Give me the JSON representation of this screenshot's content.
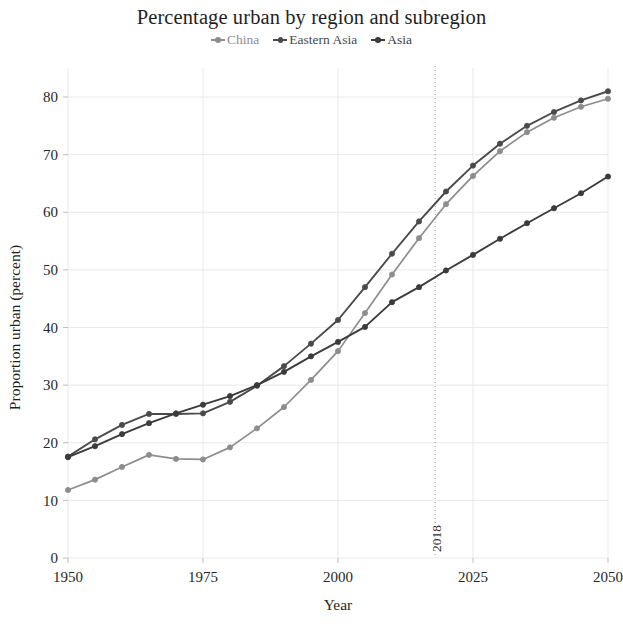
{
  "chart_data": {
    "type": "line",
    "title": "Percentage urban by region and subregion",
    "xlabel": "Year",
    "ylabel": "Proportion urban (percent)",
    "xlim": [
      1950,
      2050
    ],
    "ylim": [
      0,
      85
    ],
    "xticks": [
      1950,
      1975,
      2000,
      2025,
      2050
    ],
    "xticklabels": [
      "1950",
      "1975",
      "2000",
      "2025",
      "2050"
    ],
    "yticks": [
      0,
      10,
      20,
      30,
      40,
      50,
      60,
      70,
      80
    ],
    "yticklabels": [
      "0",
      "10",
      "20",
      "30",
      "40",
      "50",
      "60",
      "70",
      "80"
    ],
    "grid": true,
    "legend_position": "top-center",
    "markers": "circle",
    "x": [
      1950,
      1955,
      1960,
      1965,
      1970,
      1975,
      1980,
      1985,
      1990,
      1995,
      2000,
      2005,
      2010,
      2015,
      2020,
      2025,
      2030,
      2035,
      2040,
      2045,
      2050
    ],
    "series": [
      {
        "name": "China",
        "color": "#8d8d8d",
        "values": [
          11.8,
          13.6,
          15.8,
          17.9,
          17.2,
          17.1,
          19.2,
          22.5,
          26.2,
          30.9,
          35.9,
          42.5,
          49.2,
          55.5,
          61.4,
          66.3,
          70.6,
          73.9,
          76.4,
          78.3,
          79.7
        ]
      },
      {
        "name": "Eastern Asia",
        "color": "#4a4a4a",
        "values": [
          17.6,
          20.6,
          23.1,
          25.0,
          25.0,
          25.1,
          27.1,
          29.9,
          33.3,
          37.2,
          41.3,
          47.0,
          52.8,
          58.4,
          63.6,
          68.1,
          71.9,
          75.0,
          77.4,
          79.4,
          81.0
        ]
      },
      {
        "name": "Asia",
        "color": "#3b3b3b",
        "values": [
          17.5,
          19.4,
          21.5,
          23.4,
          25.1,
          26.6,
          28.1,
          30.0,
          32.3,
          35.0,
          37.5,
          40.1,
          44.4,
          47.0,
          49.9,
          52.6,
          55.4,
          58.1,
          60.7,
          63.3,
          66.2
        ]
      }
    ],
    "annotations": [
      {
        "type": "vline",
        "x": 2018,
        "label": "2018",
        "label_rotation": -90,
        "style": "dotted"
      }
    ]
  }
}
